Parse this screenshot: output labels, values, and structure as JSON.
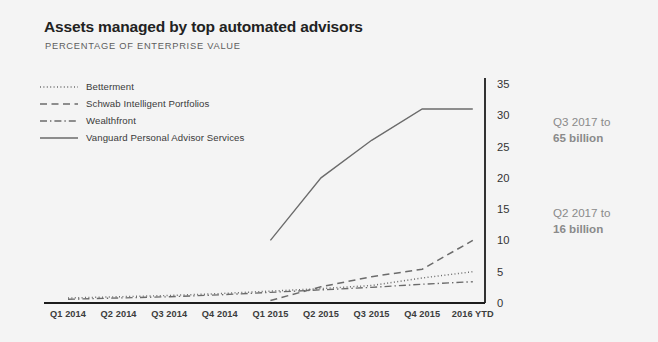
{
  "header": {
    "title": "Assets managed by top automated advisors",
    "subtitle": "PERCENTAGE OF ENTERPRISE VALUE"
  },
  "legend": {
    "items": [
      {
        "label": "Betterment",
        "style": "dotted"
      },
      {
        "label": "Schwab Intelligent Portfolios",
        "style": "dashed"
      },
      {
        "label": "Wealthfront",
        "style": "dash-dot"
      },
      {
        "label": "Vanguard Personal Advisor Services",
        "style": "solid"
      }
    ]
  },
  "annotations": [
    {
      "line1": "Q3 2017 to",
      "line2": "65 billion"
    },
    {
      "line1": "Q2 2017 to",
      "line2": "16 billion"
    }
  ],
  "colors": {
    "background": "#f4f4f4",
    "line": "#6b6b6b",
    "axis": "#1c1c1c",
    "title": "#222222",
    "subtitle": "#5d5d5d",
    "annotation": "#8a8a8a"
  },
  "chart_data": {
    "type": "line",
    "title": "Assets managed by top automated advisors",
    "subtitle": "PERCENTAGE OF ENTERPRISE VALUE",
    "xlabel": "",
    "ylabel": "",
    "categories": [
      "Q1 2014",
      "Q2 2014",
      "Q3 2014",
      "Q4 2014",
      "Q1 2015",
      "Q2 2015",
      "Q3 2015",
      "Q4 2015",
      "2016 YTD"
    ],
    "ylim": [
      0,
      35
    ],
    "yticks": [
      0,
      5,
      10,
      15,
      20,
      25,
      30,
      35
    ],
    "y_axis_position": "right",
    "grid": false,
    "legend_position": "top-left",
    "series": [
      {
        "name": "Betterment",
        "style": "dotted",
        "values": [
          0.8,
          1.0,
          1.2,
          1.5,
          1.9,
          2.3,
          2.8,
          4.0,
          5.0
        ]
      },
      {
        "name": "Schwab Intelligent Portfolios",
        "style": "dashed",
        "values": [
          null,
          null,
          null,
          null,
          0.4,
          2.6,
          4.2,
          5.4,
          10.0
        ]
      },
      {
        "name": "Wealthfront",
        "style": "dash-dot",
        "values": [
          0.6,
          0.8,
          1.0,
          1.3,
          1.7,
          2.1,
          2.5,
          3.0,
          3.4
        ]
      },
      {
        "name": "Vanguard Personal Advisor Services",
        "style": "solid",
        "values": [
          null,
          null,
          null,
          null,
          10.0,
          20.0,
          26.0,
          31.0,
          31.0
        ]
      }
    ]
  }
}
